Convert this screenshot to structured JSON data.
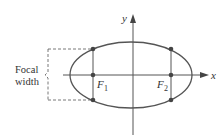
{
  "diagram": {
    "type": "ellipse-focal-width",
    "labels": {
      "y_axis": "y",
      "x_axis": "x",
      "focus1": "F",
      "focus1_sub": "1",
      "focus2": "F",
      "focus2_sub": "2",
      "bracket_line1": "Focal",
      "bracket_line2": "width"
    },
    "colors": {
      "ellipse": "#555555",
      "axes": "#555555",
      "points": "#444444",
      "text": "#333333",
      "dashed": "#555555"
    }
  }
}
